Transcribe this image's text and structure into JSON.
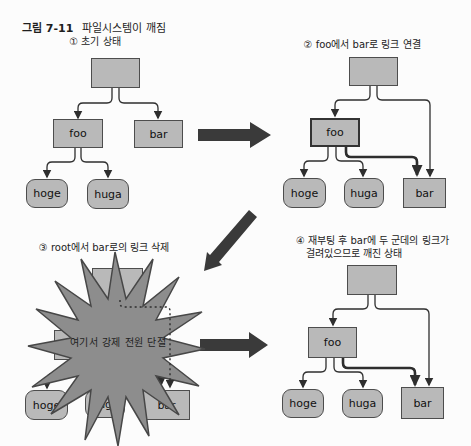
{
  "figure": {
    "label": "그림 7-11",
    "title": "파일시스템이 깨짐"
  },
  "panels": [
    {
      "caption": "① 초기 상태",
      "nodes": {
        "foo": "foo",
        "bar": "bar",
        "hoge": "hoge",
        "huga": "huga"
      }
    },
    {
      "caption": "② foo에서 bar로 링크 연결",
      "nodes": {
        "foo": "foo",
        "bar": "bar",
        "hoge": "hoge",
        "huga": "huga"
      }
    },
    {
      "caption": "③ root에서 bar로의 링크 삭제",
      "burst_text": "여기서 강제 전원 단절",
      "nodes": {
        "foo": "foo",
        "bar": "bar",
        "hoge": "hoge",
        "huga": "huga"
      }
    },
    {
      "caption_line1": "④ 재부팅 후 bar에 두 군데의 링크가",
      "caption_line2": "걸려있으므로 깨진 상태",
      "nodes": {
        "foo": "foo",
        "bar": "bar",
        "hoge": "hoge",
        "huga": "huga"
      }
    }
  ],
  "colors": {
    "box_fill": "#b9b9b9",
    "box_border": "#4d4d4d",
    "burst_fill": "#8d8d8d",
    "link_line": "#2e2e2e",
    "transition_arrow": "#3a3a3a",
    "background": "#fcfcfc"
  }
}
